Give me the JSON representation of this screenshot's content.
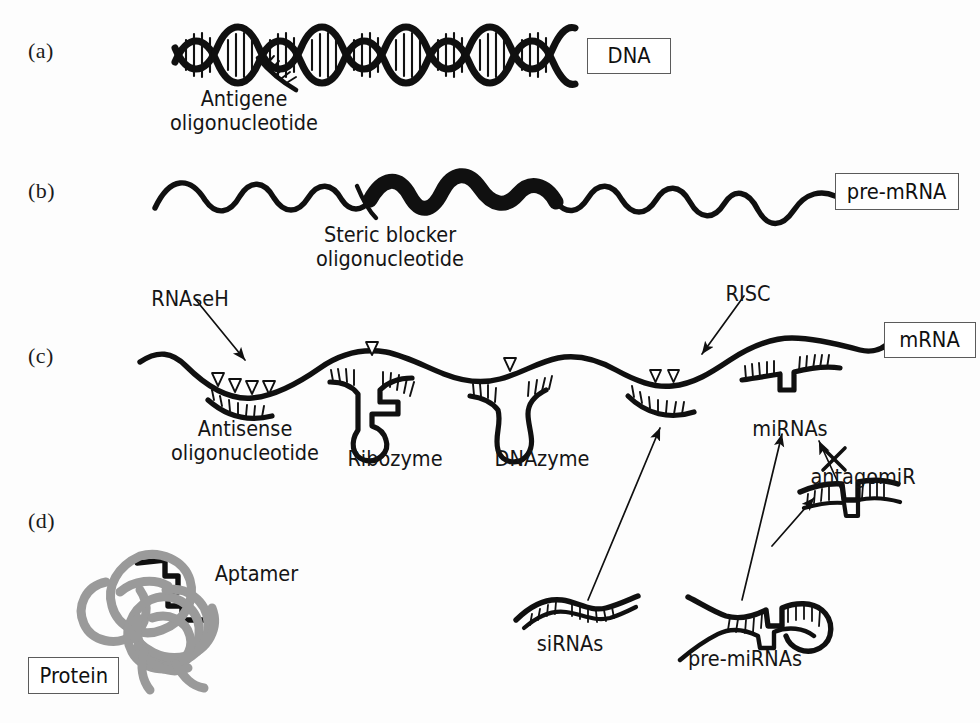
{
  "figure": {
    "background_color": "#fdfdfd",
    "ink_color": "#101010",
    "protein_color": "#9a9a9a",
    "box_border_color": "#5b5b5b"
  },
  "panels": [
    {
      "id": "a",
      "label": "(a)",
      "x": 28,
      "y": 38,
      "target": "DNA"
    },
    {
      "id": "b",
      "label": "(b)",
      "x": 28,
      "y": 178,
      "target": "pre-mRNA"
    },
    {
      "id": "c",
      "label": "(c)",
      "x": 28,
      "y": 343,
      "target": "mRNA"
    },
    {
      "id": "d",
      "label": "(d)",
      "x": 28,
      "y": 508,
      "target": "Protein"
    }
  ],
  "target_boxes": [
    {
      "name": "dna",
      "label": "DNA",
      "x": 587,
      "y": 38,
      "w": 84,
      "h": 36
    },
    {
      "name": "pre_mrna",
      "label": "pre-mRNA",
      "x": 835,
      "y": 173,
      "w": 124,
      "h": 37
    },
    {
      "name": "mrna",
      "label": "mRNA",
      "x": 884,
      "y": 322,
      "w": 92,
      "h": 36
    },
    {
      "name": "protein",
      "label": "Protein",
      "x": 28,
      "y": 657,
      "w": 91,
      "h": 37
    }
  ],
  "annotations": [
    {
      "name": "antigene-oligonucleotide",
      "lines": [
        "Antigene",
        "oligonucleotide"
      ],
      "x": 244,
      "y": 88,
      "align": "center"
    },
    {
      "name": "steric-blocker-oligonucleotide",
      "lines": [
        "Steric blocker",
        "oligonucleotide"
      ],
      "x": 390,
      "y": 224,
      "align": "center"
    },
    {
      "name": "rnaseh",
      "lines": [
        "RNAseH"
      ],
      "x": 190,
      "y": 288,
      "align": "center"
    },
    {
      "name": "risc",
      "lines": [
        "RISC"
      ],
      "x": 748,
      "y": 283,
      "align": "center"
    },
    {
      "name": "antisense-oligonucleotide",
      "lines": [
        "Antisense",
        "oligonucleotide"
      ],
      "x": 245,
      "y": 418,
      "align": "center"
    },
    {
      "name": "ribozyme",
      "lines": [
        "Ribozyme"
      ],
      "x": 395,
      "y": 448,
      "align": "center"
    },
    {
      "name": "dnazyme",
      "lines": [
        "DNAzyme"
      ],
      "x": 542,
      "y": 448,
      "align": "center"
    },
    {
      "name": "mirnas",
      "lines": [
        "miRNAs"
      ],
      "x": 790,
      "y": 418,
      "align": "center"
    },
    {
      "name": "antagomir",
      "lines": [
        "antagomiR"
      ],
      "x": 862,
      "y": 466,
      "align": "center"
    },
    {
      "name": "aptamer",
      "lines": [
        "Aptamer"
      ],
      "x": 253,
      "y": 563,
      "align": "left"
    },
    {
      "name": "sirnas",
      "lines": [
        "siRNAs"
      ],
      "x": 570,
      "y": 633,
      "align": "center"
    },
    {
      "name": "pre-mirnas",
      "lines": [
        "pre-miRNAs"
      ],
      "x": 745,
      "y": 648,
      "align": "center"
    }
  ],
  "structures": {
    "dna_helix": {
      "x_start": 175,
      "x_end": 575,
      "y_center": 55,
      "turns": 6,
      "amplitude": 22
    },
    "antigene_oligo": {
      "x": 255,
      "y": 60,
      "length": 52
    },
    "pre_mrna_strand": {
      "x_start": 155,
      "x_end": 845,
      "y_center": 195,
      "thick_segment": [
        385,
        560
      ]
    },
    "steric_blocker": {
      "x": 358,
      "y": 188,
      "length": 40
    },
    "mrna_strand": {
      "x_start": 140,
      "x_end": 890,
      "y_center": 375
    },
    "cleavage_markers": {
      "antisense_triangles": 4,
      "ribozyme_triangles": 1,
      "dnazyme_triangles": 1,
      "risc_triangles": 2
    }
  },
  "arrows": [
    {
      "name": "rnaseh-arrow",
      "from": [
        196,
        300
      ],
      "to": [
        247,
        362
      ]
    },
    {
      "name": "risc-arrow",
      "from": [
        742,
        296
      ],
      "to": [
        700,
        356
      ]
    },
    {
      "name": "sirna-to-risc-arrow",
      "from": [
        588,
        600
      ],
      "to": [
        658,
        426
      ]
    },
    {
      "name": "premirna-to-mirna-arrow",
      "from": [
        742,
        600
      ],
      "to": [
        780,
        432
      ]
    },
    {
      "name": "premirna-to-antagomir-arrow",
      "from": [
        772,
        545
      ],
      "to": [
        815,
        495
      ]
    },
    {
      "name": "antagomir-inhibition-arrow",
      "from": [
        838,
        490
      ],
      "to": [
        817,
        440
      ]
    }
  ],
  "inhibition_marker": {
    "name": "antagomir-block-x",
    "symbol": "X",
    "x": 833,
    "y": 455
  }
}
